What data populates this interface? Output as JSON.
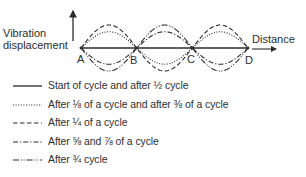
{
  "diagram": {
    "y_axis_label_line1": "Vibration",
    "y_axis_label_line2": "displacement",
    "x_axis_label": "Distance",
    "nodes": [
      "A",
      "B",
      "C",
      "D"
    ],
    "ink_color": "#2b2b2b",
    "curves": [
      {
        "id": "start-and-half-cycle",
        "style": "solid",
        "relative_displacement": 0
      },
      {
        "id": "eighth-and-three-eighths-cycle",
        "style": "dotted",
        "relative_displacement": 0.707
      },
      {
        "id": "quarter-cycle",
        "style": "dashed",
        "relative_displacement": 1
      },
      {
        "id": "five-and-seven-eighths-cycle",
        "style": "dash-dot",
        "relative_displacement": -0.707
      },
      {
        "id": "three-quarters-cycle",
        "style": "dash-dot-dot",
        "relative_displacement": -1
      }
    ]
  },
  "legend": [
    {
      "style": "solid",
      "label": "Start of cycle and after ½ cycle"
    },
    {
      "style": "dotted",
      "label": "After ⅛ of a cycle and after ⅜ of a cycle"
    },
    {
      "style": "dashed",
      "label": "After ¼ of a cycle"
    },
    {
      "style": "dash-dot",
      "label": "After ⅝ and ⅞ of a cycle"
    },
    {
      "style": "dash-dot-dot",
      "label": "After ¾ cycle"
    }
  ]
}
